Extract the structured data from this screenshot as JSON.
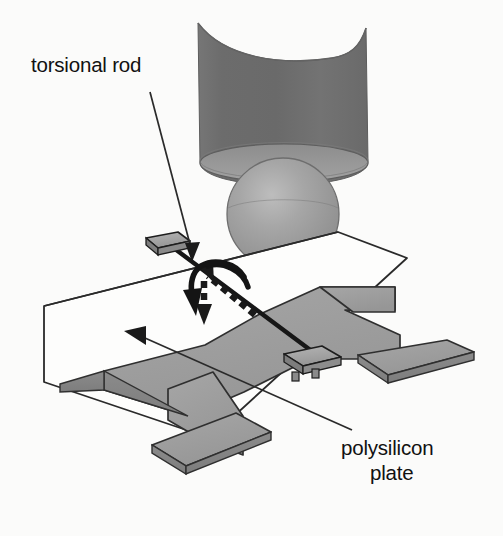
{
  "figure": {
    "kind": "technical-illustration",
    "background_color": "#fbfbfa"
  },
  "labels": {
    "torsional_rod": "torsional rod",
    "polysilicon_plate_line1": "polysilicon",
    "polysilicon_plate_line2": "plate"
  },
  "colors": {
    "tube_dark_gray": "#6f6f6f",
    "tube_rim_gray": "#8d8d8d",
    "sphere_gray": "#9a9a9a",
    "sphere_highlight": "#c2c2c2",
    "plate_gray": "#9e9e9e",
    "plate_edge_gray": "#808080",
    "substrate_white": "#fdfdfc",
    "outline_black": "#1a1a1a",
    "anchor_gray": "#a5a5a5",
    "text_black": "#111111"
  },
  "parts": {
    "probe_tube": "probe-tube",
    "probe_sphere": "probe-sphere",
    "field_lines": "field-lines",
    "substrate_outline": "substrate-outline",
    "polysilicon_plate_body": "polysilicon-plate-body",
    "torsional_rod_shaft": "torsional-rod-shaft",
    "left_anchor": "left-anchor-block",
    "right_anchor": "right-anchor-block",
    "rotation_arrow": "rotation-curved-arrow",
    "rod_axis_dashed": "rod-axis-dashed-arrow",
    "leader_torsional_rod": "leader-line-torsional-rod",
    "leader_polysilicon_plate": "leader-line-polysilicon-plate"
  },
  "annotations": {
    "field_line_count": 5,
    "anchor_count": 2,
    "plate_tab_count": 3
  }
}
